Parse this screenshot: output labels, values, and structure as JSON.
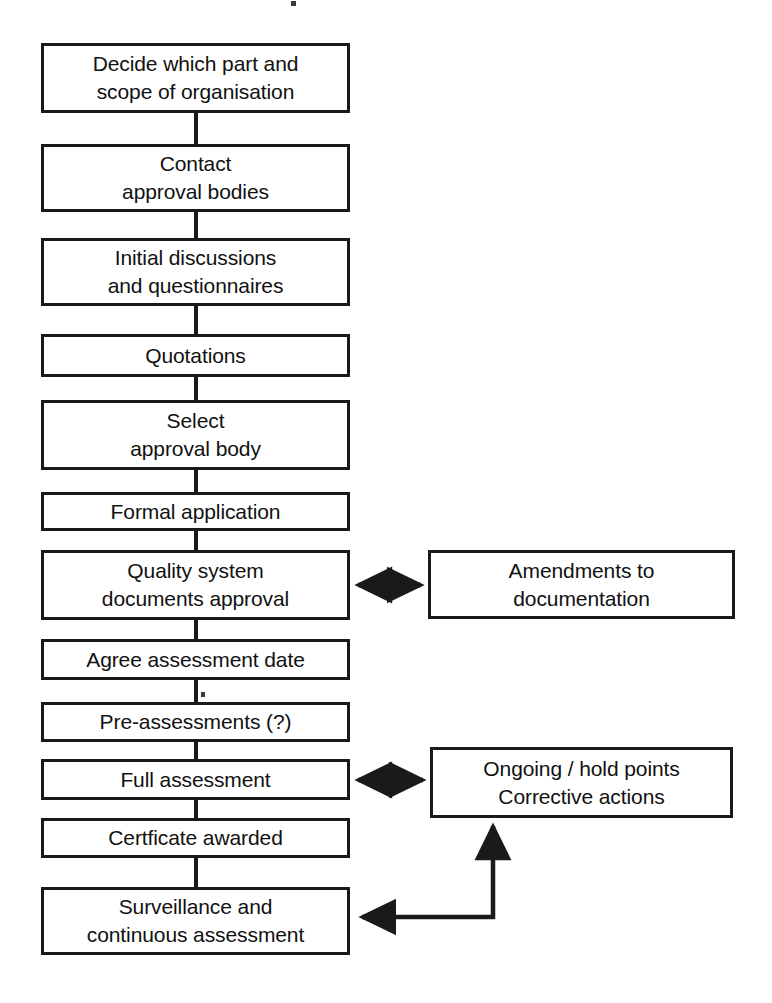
{
  "diagram": {
    "ink_color": "#1a1a1a",
    "background_color": "#ffffff"
  },
  "main_flow": [
    {
      "id": "decide-scope",
      "lines": [
        "Decide which part and",
        "scope of organisation"
      ]
    },
    {
      "id": "contact-bodies",
      "lines": [
        "Contact",
        "approval bodies"
      ]
    },
    {
      "id": "initial-discussions",
      "lines": [
        "Initial discussions",
        "and questionnaires"
      ]
    },
    {
      "id": "quotations",
      "lines": [
        "Quotations"
      ]
    },
    {
      "id": "select-body",
      "lines": [
        "Select",
        "approval body"
      ]
    },
    {
      "id": "formal-application",
      "lines": [
        "Formal application"
      ]
    },
    {
      "id": "quality-documents",
      "lines": [
        "Quality system",
        "documents approval"
      ]
    },
    {
      "id": "agree-date",
      "lines": [
        "Agree assessment date"
      ]
    },
    {
      "id": "pre-assessments",
      "lines": [
        "Pre-assessments (?)"
      ]
    },
    {
      "id": "full-assessment",
      "lines": [
        "Full assessment"
      ]
    },
    {
      "id": "certificate-awarded",
      "lines": [
        "Certficate awarded"
      ]
    },
    {
      "id": "surveillance",
      "lines": [
        "Surveillance and",
        "continuous assessment"
      ]
    }
  ],
  "side_nodes": [
    {
      "id": "amendments",
      "lines": [
        "Amendments to",
        "documentation"
      ]
    },
    {
      "id": "ongoing-actions",
      "lines": [
        "Ongoing / hold points",
        "Corrective actions"
      ]
    }
  ],
  "connections": [
    {
      "from": "decide-scope",
      "to": "contact-bodies",
      "style": "line"
    },
    {
      "from": "contact-bodies",
      "to": "initial-discussions",
      "style": "line"
    },
    {
      "from": "initial-discussions",
      "to": "quotations",
      "style": "line"
    },
    {
      "from": "quotations",
      "to": "select-body",
      "style": "line"
    },
    {
      "from": "select-body",
      "to": "formal-application",
      "style": "line"
    },
    {
      "from": "formal-application",
      "to": "quality-documents",
      "style": "line"
    },
    {
      "from": "quality-documents",
      "to": "agree-date",
      "style": "line"
    },
    {
      "from": "agree-date",
      "to": "pre-assessments",
      "style": "line"
    },
    {
      "from": "pre-assessments",
      "to": "full-assessment",
      "style": "line"
    },
    {
      "from": "full-assessment",
      "to": "certificate-awarded",
      "style": "line"
    },
    {
      "from": "certificate-awarded",
      "to": "surveillance",
      "style": "line"
    },
    {
      "from": "quality-documents",
      "to": "amendments",
      "style": "double-arrow"
    },
    {
      "from": "full-assessment",
      "to": "ongoing-actions",
      "style": "double-arrow"
    },
    {
      "from": "surveillance",
      "to": "ongoing-actions",
      "style": "arrow-loop"
    }
  ]
}
